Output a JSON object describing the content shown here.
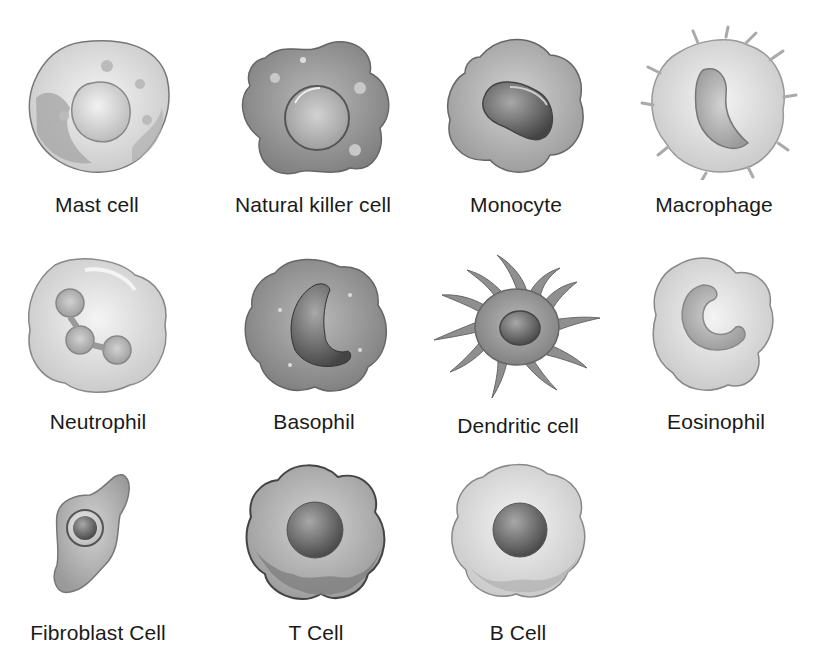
{
  "diagram": {
    "cells": [
      {
        "id": "mast-cell",
        "label": "Mast cell",
        "row": 1,
        "col": 1
      },
      {
        "id": "natural-killer-cell",
        "label": "Natural killer cell",
        "row": 1,
        "col": 2
      },
      {
        "id": "monocyte",
        "label": "Monocyte",
        "row": 1,
        "col": 3
      },
      {
        "id": "macrophage",
        "label": "Macrophage",
        "row": 1,
        "col": 4
      },
      {
        "id": "neutrophil",
        "label": "Neutrophil",
        "row": 2,
        "col": 1
      },
      {
        "id": "basophil",
        "label": "Basophil",
        "row": 2,
        "col": 2
      },
      {
        "id": "dendritic-cell",
        "label": "Dendritic cell",
        "row": 2,
        "col": 3
      },
      {
        "id": "eosinophil",
        "label": "Eosinophil",
        "row": 2,
        "col": 4
      },
      {
        "id": "fibroblast-cell",
        "label": "Fibroblast Cell",
        "row": 3,
        "col": 1
      },
      {
        "id": "t-cell",
        "label": "T Cell",
        "row": 3,
        "col": 2
      },
      {
        "id": "b-cell",
        "label": "B Cell",
        "row": 3,
        "col": 3
      }
    ],
    "colors": {
      "text": "#1a1a1a",
      "background": "#ffffff",
      "cytoplasm_light": "#e6e6e6",
      "cytoplasm_mid": "#b5b5b5",
      "cytoplasm_dark": "#8f8f8f",
      "nucleus_dark": "#5a5a5a",
      "outline": "#6e6e6e"
    }
  }
}
